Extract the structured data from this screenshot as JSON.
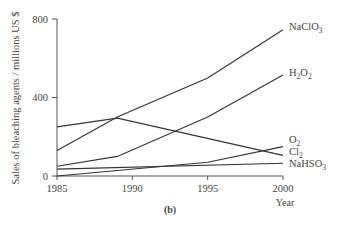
{
  "chart_data": {
    "type": "line",
    "title": "",
    "caption": "(b)",
    "xlabel": "Year",
    "ylabel": "Sales of bleaching agents / millions US $",
    "xlim": [
      1985,
      2000
    ],
    "ylim": [
      0,
      800
    ],
    "x_ticks": [
      1985,
      1990,
      1995,
      2000
    ],
    "y_ticks": [
      0,
      400,
      800
    ],
    "grid": false,
    "legend": "inline labels at right end of lines",
    "series": [
      {
        "name": "NaClO3",
        "label_main": "NaClO",
        "label_sub": "3",
        "x": [
          1985,
          1989,
          1995,
          2000
        ],
        "values": [
          130,
          300,
          500,
          745
        ]
      },
      {
        "name": "H2O2",
        "label_main": "H",
        "label_sub": "2",
        "label_main2": "O",
        "label_sub2": "2",
        "x": [
          1985,
          1989,
          1995,
          2000
        ],
        "values": [
          50,
          100,
          300,
          515
        ]
      },
      {
        "name": "O2",
        "label_main": "O",
        "label_sub": "2",
        "x": [
          1985,
          1995,
          2000
        ],
        "values": [
          0,
          70,
          150
        ]
      },
      {
        "name": "Cl2",
        "label_main": "Cl",
        "label_sub": "2",
        "x": [
          1985,
          1989,
          2000
        ],
        "values": [
          250,
          295,
          105
        ]
      },
      {
        "name": "NaHSO3",
        "label_main": "NaHSO",
        "label_sub": "3",
        "x": [
          1985,
          2000
        ],
        "values": [
          35,
          65
        ]
      }
    ]
  }
}
